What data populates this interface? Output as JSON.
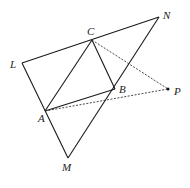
{
  "diagram": {
    "type": "geometry",
    "points": {
      "L": {
        "label": "L",
        "x": 22,
        "y": 63,
        "lx": 10,
        "ly": 68
      },
      "N": {
        "label": "N",
        "x": 159,
        "y": 17,
        "lx": 163,
        "ly": 19
      },
      "M": {
        "label": "M",
        "x": 68,
        "y": 158,
        "lx": 62,
        "ly": 171
      },
      "C": {
        "label": "C",
        "x": 92,
        "y": 40,
        "lx": 87,
        "ly": 35
      },
      "A": {
        "label": "A",
        "x": 45,
        "y": 111,
        "lx": 38,
        "ly": 122
      },
      "B": {
        "label": "B",
        "x": 115,
        "y": 89,
        "lx": 119,
        "ly": 93
      },
      "P": {
        "label": "P",
        "x": 168,
        "y": 89,
        "lx": 174,
        "ly": 95
      }
    },
    "solid_segments": [
      [
        "L",
        "N"
      ],
      [
        "N",
        "M"
      ],
      [
        "M",
        "L"
      ],
      [
        "A",
        "C"
      ],
      [
        "C",
        "B"
      ],
      [
        "A",
        "B"
      ]
    ],
    "dashed_segments": [
      [
        "C",
        "P"
      ],
      [
        "A",
        "P"
      ]
    ],
    "marked_points": [
      "P"
    ]
  }
}
